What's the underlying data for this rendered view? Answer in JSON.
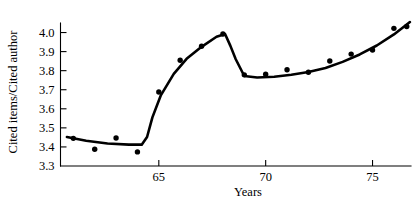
{
  "chart_data": {
    "type": "scatter",
    "title": "",
    "xlabel": "Years",
    "ylabel": "Cited items/Cited author",
    "xlim": [
      60.4,
      76.8
    ],
    "ylim": [
      3.3,
      4.05
    ],
    "grid": false,
    "legend": "none",
    "x_ticks": [
      65,
      70,
      75
    ],
    "x_tick_labels": [
      "65",
      "70",
      "75"
    ],
    "y_ticks": [
      3.3,
      3.4,
      3.5,
      3.6,
      3.7,
      3.8,
      3.9,
      4.0
    ],
    "y_tick_labels": [
      "3.3",
      "3.4",
      "3.5",
      "3.6",
      "3.7",
      "3.8",
      "3.9",
      "4.0"
    ],
    "x": [
      61.0,
      62.0,
      63.0,
      64.0,
      65.0,
      66.0,
      67.0,
      68.0,
      69.0,
      70.0,
      71.0,
      72.0,
      73.0,
      74.0,
      75.0,
      76.0,
      76.6
    ],
    "values": [
      3.445,
      3.388,
      3.447,
      3.374,
      3.688,
      3.855,
      3.928,
      3.992,
      3.778,
      3.781,
      3.805,
      3.792,
      3.851,
      3.887,
      3.908,
      4.022,
      4.032
    ],
    "series": [
      {
        "name": "Cited items per cited author",
        "marker": "filled-circle",
        "x": [
          61.0,
          62.0,
          63.0,
          64.0,
          65.0,
          66.0,
          67.0,
          68.0,
          69.0,
          70.0,
          71.0,
          72.0,
          73.0,
          74.0,
          75.0,
          76.0,
          76.6
        ],
        "values": [
          3.445,
          3.388,
          3.447,
          3.374,
          3.688,
          3.855,
          3.928,
          3.992,
          3.778,
          3.781,
          3.805,
          3.792,
          3.851,
          3.887,
          3.908,
          4.022,
          4.032
        ]
      },
      {
        "name": "Fitted trend line",
        "marker": "none",
        "x": [
          60.7,
          61.6,
          62.6,
          63.6,
          64.2,
          64.45,
          64.7,
          65.1,
          65.7,
          66.3,
          67.0,
          67.7,
          68.1,
          68.35,
          68.6,
          69.0,
          69.6,
          70.4,
          71.2,
          72.0,
          72.8,
          73.6,
          74.4,
          75.2,
          76.0,
          76.75
        ],
        "values": [
          3.452,
          3.432,
          3.418,
          3.412,
          3.412,
          3.452,
          3.555,
          3.672,
          3.783,
          3.862,
          3.925,
          3.978,
          3.992,
          3.93,
          3.86,
          3.772,
          3.764,
          3.768,
          3.779,
          3.793,
          3.814,
          3.846,
          3.885,
          3.932,
          3.99,
          4.055
        ]
      }
    ],
    "axis_color": "#000000",
    "marker_color": "#000000",
    "line_color": "#000000",
    "background_color": "#ffffff"
  }
}
